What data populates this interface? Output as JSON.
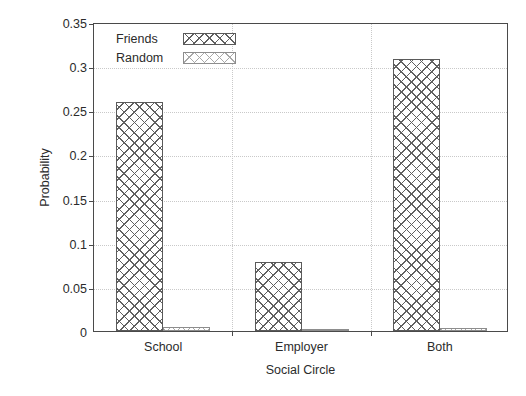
{
  "chart_data": {
    "type": "bar",
    "title": "",
    "xlabel": "Social Circle",
    "ylabel": "Probability",
    "categories": [
      "School",
      "Employer",
      "Both"
    ],
    "series": [
      {
        "name": "Friends",
        "values": [
          0.259,
          0.078,
          0.308
        ]
      },
      {
        "name": "Random",
        "values": [
          0.004,
          0.0005,
          0.003
        ]
      }
    ],
    "ylim": [
      0,
      0.35
    ],
    "ytick_values": [
      0,
      0.05,
      0.1,
      0.15,
      0.2,
      0.25,
      0.3,
      0.35
    ],
    "ytick_labels": [
      "0",
      "0.05",
      "0.1",
      "0.15",
      "0.2",
      "0.25",
      "0.3",
      "0.35"
    ],
    "grid": true,
    "legend_position": "upper left inside axes",
    "colors": {
      "axis": "#4a4a4a",
      "grid": "#c9c9c9",
      "friends_pattern": "#606060",
      "random_pattern": "#a8a8a8",
      "background": "#ffffff",
      "text": "#2b2b2b"
    }
  },
  "legend": {
    "entries": [
      {
        "label": "Friends",
        "swatch": "dense-crosshatch-swatch"
      },
      {
        "label": "Random",
        "swatch": "sparse-crosshatch-swatch"
      }
    ]
  },
  "axes": {
    "y_title": "Probability",
    "x_title": "Social Circle"
  }
}
